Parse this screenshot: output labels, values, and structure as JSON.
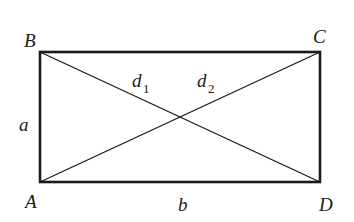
{
  "diagram": {
    "vertices": {
      "A": {
        "label": "A",
        "x": 40,
        "y": 182
      },
      "B": {
        "label": "B",
        "x": 40,
        "y": 52
      },
      "C": {
        "label": "C",
        "x": 320,
        "y": 52
      },
      "D": {
        "label": "D",
        "x": 320,
        "y": 182
      }
    },
    "sides": {
      "a": {
        "label": "a",
        "from": "A",
        "to": "B"
      },
      "b": {
        "label": "b",
        "from": "A",
        "to": "D"
      }
    },
    "diagonals": {
      "d1": {
        "base": "d",
        "sub": "1",
        "from": "B",
        "to": "D"
      },
      "d2": {
        "base": "d",
        "sub": "2",
        "from": "A",
        "to": "C"
      }
    },
    "colors": {
      "stroke": "#1a1a1a",
      "background": "#ffffff"
    }
  }
}
